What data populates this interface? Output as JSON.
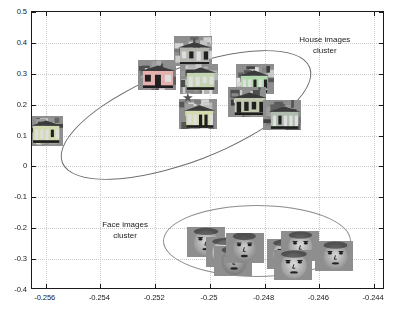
{
  "chart_data": {
    "type": "scatter",
    "title": "",
    "xlabel": "",
    "ylabel": "",
    "xlim": [
      -0.2565,
      -0.2436
    ],
    "ylim": [
      -0.4,
      0.5
    ],
    "grid": true,
    "x_ticks": [
      "-0.256",
      "-0.254",
      "-0.252",
      "-0.25",
      "-0.248",
      "-0.246",
      "-0.244"
    ],
    "x_tick_values": [
      -0.256,
      -0.254,
      -0.252,
      -0.25,
      -0.248,
      -0.246,
      -0.244
    ],
    "y_ticks": [
      "0.5",
      "0.4",
      "0.3",
      "0.2",
      "0.1",
      "0",
      "-0.1",
      "-0.2",
      "-0.3",
      "-0.4"
    ],
    "y_tick_values": [
      0.5,
      0.4,
      0.3,
      0.2,
      0.1,
      0,
      -0.1,
      -0.2,
      -0.3,
      -0.4
    ],
    "annotations": [
      {
        "name": "house-cluster-label",
        "text": "House images\ncluster",
        "x": -0.2458,
        "y": 0.392
      },
      {
        "name": "face-cluster-label",
        "text": "Face images\ncluster",
        "x": -0.2531,
        "y": -0.2045
      }
    ],
    "series": [
      {
        "name": "House images",
        "marker": "image-thumbnail",
        "kind": "house",
        "points": [
          {
            "x": -0.25605,
            "y": 0.115
          },
          {
            "x": -0.25195,
            "y": 0.297
          },
          {
            "x": -0.2506,
            "y": 0.373
          },
          {
            "x": -0.2504,
            "y": 0.282
          },
          {
            "x": -0.25045,
            "y": 0.17
          },
          {
            "x": -0.24835,
            "y": 0.282
          },
          {
            "x": -0.24865,
            "y": 0.208
          },
          {
            "x": -0.24735,
            "y": 0.168
          }
        ]
      },
      {
        "name": "Face images",
        "marker": "image-thumbnail",
        "kind": "face",
        "points": [
          {
            "x": -0.25015,
            "y": -0.243
          },
          {
            "x": -0.24945,
            "y": -0.277
          },
          {
            "x": -0.24915,
            "y": -0.305
          },
          {
            "x": -0.2487,
            "y": -0.263
          },
          {
            "x": -0.2472,
            "y": -0.283
          },
          {
            "x": -0.2467,
            "y": -0.258
          },
          {
            "x": -0.24695,
            "y": -0.318
          },
          {
            "x": -0.24545,
            "y": -0.29
          }
        ]
      },
      {
        "name": "Centroid",
        "marker": "star",
        "points": [
          {
            "x": -0.2508,
            "y": 0.225
          }
        ]
      }
    ],
    "ellipses": [
      {
        "name": "house-cluster-ellipse",
        "center_x": -0.25175,
        "center_y": 0.238,
        "rotation_deg": -21,
        "color": "#6a6a6a"
      },
      {
        "name": "face-cluster-ellipse",
        "center_x": -0.2479,
        "center_y": -0.28,
        "rotation_deg": 0,
        "color": "#8d8d8d"
      }
    ]
  },
  "colors": {
    "axis": "#1a1a1a",
    "grid": "#c9c9c9",
    "house_ellipse": "#6a6a6a",
    "face_ellipse": "#8d8d8d",
    "thumbnail_bg": "#8e8e8e",
    "star": "#555555",
    "background": "#ffffff"
  },
  "labels": {
    "house_cluster_line1": "House images",
    "house_cluster_line2": "cluster",
    "face_cluster_line1": "Face images",
    "face_cluster_line2": "cluster",
    "star_marker": "★"
  }
}
